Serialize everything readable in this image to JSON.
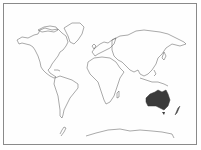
{
  "map": {
    "type": "world-outline",
    "highlighted_region": "Australia",
    "colors": {
      "outline": "#555555",
      "highlight_fill": "#3a3a3a",
      "frame_border": "#8a8a8a",
      "background": "#ffffff"
    }
  }
}
